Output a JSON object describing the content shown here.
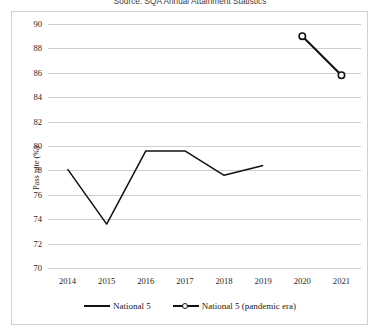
{
  "source_caption": "Source: SQA Annual Attainment Statistics",
  "legend": {
    "entries": [
      {
        "label": "National 5",
        "style": "line",
        "color": "#111111"
      },
      {
        "label": "National 5 (pandemic era)",
        "style": "line-marker",
        "color": "#111111"
      }
    ]
  },
  "chart_data": {
    "type": "line",
    "title": "",
    "subtitle": "",
    "xlabel": "",
    "ylabel": "Pass rate (%)",
    "categories": [
      "2014",
      "2015",
      "2016",
      "2017",
      "2018",
      "2019",
      "2020",
      "2021"
    ],
    "x_tick_labels": [
      "2014",
      "2015",
      "2016",
      "2017",
      "2018",
      "2019",
      "2020",
      "2021"
    ],
    "y_tick_labels": [
      "70",
      "72",
      "74",
      "76",
      "78",
      "80",
      "82",
      "84",
      "86",
      "88",
      "90"
    ],
    "y_ticks": [
      70,
      72,
      74,
      76,
      78,
      80,
      82,
      84,
      86,
      88,
      90
    ],
    "ylim": [
      70,
      90
    ],
    "grid": "horizontal",
    "legend_position": "bottom-center",
    "series": [
      {
        "name": "National 5",
        "color": "#111111",
        "marker": "none",
        "x": [
          "2014",
          "2015",
          "2016",
          "2017",
          "2018",
          "2019"
        ],
        "values": [
          78.1,
          73.6,
          79.6,
          79.6,
          77.6,
          78.4
        ]
      },
      {
        "name": "National 5 (pandemic era)",
        "color": "#111111",
        "marker": "circle-open",
        "x": [
          "2020",
          "2021"
        ],
        "values": [
          89.0,
          85.8
        ]
      }
    ]
  }
}
